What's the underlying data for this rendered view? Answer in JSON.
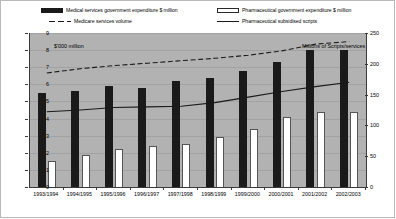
{
  "legend": {
    "items": [
      {
        "label": "Medical services government expenditure  $ million",
        "marker": "black-square-swatch"
      },
      {
        "label": "Pharmaceutical government expenditure $ million",
        "marker": "white-square-swatch"
      },
      {
        "label": "Medicare services volume",
        "marker": "dashed-line-swatch"
      },
      {
        "label": "Pharmaceutical subsidised scripts",
        "marker": "solid-line-swatch"
      }
    ]
  },
  "annotations": {
    "left_unit": "$'000 million",
    "right_unit": "Millions of Scripts/services"
  },
  "chart_data": {
    "type": "bar",
    "title": "",
    "xlabel": "",
    "ylabel": "$'000 million",
    "y2label": "Millions of Scripts/services",
    "grid": true,
    "legend_position": "top",
    "ylim": [
      0,
      9
    ],
    "y2lim": [
      0,
      250
    ],
    "yticks": [
      "0",
      "1",
      "2",
      "3",
      "4",
      "5",
      "6",
      "7",
      "8",
      "9"
    ],
    "y2ticks": [
      "0",
      "50",
      "100",
      "150",
      "200",
      "250"
    ],
    "categories": [
      "1993/1994",
      "1994/1995",
      "1995/1996",
      "1996/1997",
      "1997/1998",
      "1998/1999",
      "1999/2000",
      "2000/2001",
      "2001/2002",
      "2002/2003"
    ],
    "series": [
      {
        "name": "Medical services government expenditure  $ million",
        "kind": "bar",
        "axis": "left",
        "color": "#1a1a1a",
        "values": [
          5.5,
          5.6,
          5.9,
          5.8,
          6.2,
          6.4,
          6.8,
          7.3,
          8.0,
          8.0
        ]
      },
      {
        "name": "Pharmaceutical government expenditure $ million",
        "kind": "bar",
        "axis": "left",
        "color": "#ffffff",
        "values": [
          1.5,
          1.9,
          2.2,
          2.4,
          2.5,
          2.9,
          3.4,
          4.1,
          4.4,
          4.4
        ]
      },
      {
        "name": "Medicare services volume",
        "kind": "line-dashed",
        "axis": "right",
        "color": "#1a1a1a",
        "values": [
          185,
          192,
          197,
          201,
          205,
          209,
          214,
          221,
          232,
          236
        ]
      },
      {
        "name": "Pharmaceutical subsidised scripts",
        "kind": "line-solid",
        "axis": "right",
        "color": "#1a1a1a",
        "values": [
          122,
          125,
          129,
          130,
          131,
          137,
          146,
          155,
          163,
          170
        ]
      }
    ]
  }
}
